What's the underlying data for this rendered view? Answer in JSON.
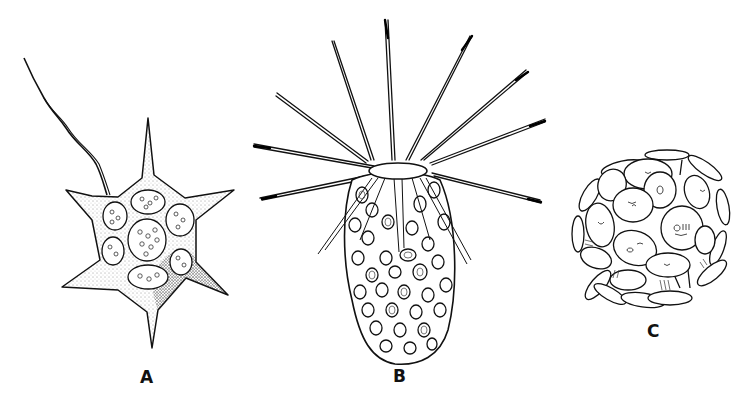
{
  "figure": {
    "background": "#ffffff",
    "ink_color": "#111111",
    "panels": [
      {
        "id": "A",
        "label": "A",
        "description": "star-shaped cell with six tapering spines, a long trailing flagellum and several round granular inclusions; stippled shading"
      },
      {
        "id": "B",
        "label": "B",
        "description": "elongated oval cell with an oval opening at the top surrounded by a crown of long radiating spines; body filled with ring-shaped inclusions"
      },
      {
        "id": "C",
        "label": "C",
        "description": "spherical cluster of trumpet-shaped disc plates (coccoliths)"
      }
    ]
  }
}
